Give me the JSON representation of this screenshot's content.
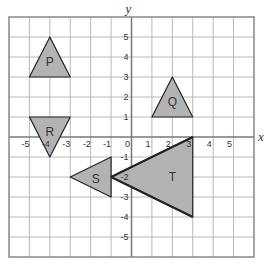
{
  "chart_data": {
    "type": "coordinate-grid",
    "title": "",
    "xlabel": "x",
    "ylabel": "y",
    "xlim": [
      -6,
      6
    ],
    "ylim": [
      -6,
      6
    ],
    "grid": true,
    "x_ticks": [
      -5,
      -4,
      -3,
      -2,
      -1,
      0,
      1,
      2,
      3,
      4,
      5
    ],
    "x_tick_labels": [
      "-5",
      "-4",
      "-3",
      "-2",
      "-1",
      "0",
      "1",
      "2",
      "3",
      "4",
      "5"
    ],
    "y_ticks": [
      5,
      4,
      3,
      2,
      1,
      -1,
      -2,
      -3,
      -4,
      -5
    ],
    "y_tick_labels": [
      "5",
      "4",
      "3",
      "2",
      "1",
      "-1",
      "-2",
      "-3",
      "-4",
      "-5"
    ],
    "colors": {
      "shape_fill": "#b3b3b3",
      "shape_stroke": "#222222",
      "grid": "#b8b8b8",
      "axis": "#777777",
      "border": "#888888"
    },
    "shapes": [
      {
        "name": "P",
        "vertices": [
          [
            -4,
            5
          ],
          [
            -5,
            3
          ],
          [
            -3,
            3
          ]
        ],
        "label_at": [
          -4,
          3.75
        ],
        "bold_edges": []
      },
      {
        "name": "Q",
        "vertices": [
          [
            2,
            3
          ],
          [
            1,
            1
          ],
          [
            3,
            1
          ]
        ],
        "label_at": [
          2,
          1.75
        ],
        "bold_edges": []
      },
      {
        "name": "R",
        "vertices": [
          [
            -5,
            1
          ],
          [
            -3,
            1
          ],
          [
            -4,
            -1
          ]
        ],
        "label_at": [
          -4,
          0.25
        ],
        "bold_edges": []
      },
      {
        "name": "S",
        "vertices": [
          [
            -3,
            -2
          ],
          [
            -1,
            -1
          ],
          [
            -1,
            -3
          ]
        ],
        "label_at": [
          -1.75,
          -2.1
        ],
        "bold_edges": []
      },
      {
        "name": "T",
        "vertices": [
          [
            -1,
            -2
          ],
          [
            3,
            0
          ],
          [
            3,
            -4
          ]
        ],
        "label_at": [
          2,
          -2
        ],
        "bold_edges": [
          [
            0,
            1
          ],
          [
            0,
            2
          ]
        ]
      }
    ]
  }
}
